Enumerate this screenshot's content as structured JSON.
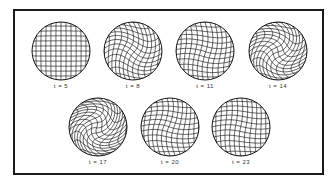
{
  "figure": {
    "panels": [
      {
        "label": "t = 5",
        "t": 5,
        "cx": 61,
        "cy": 51,
        "r": 29,
        "twist": 0.0,
        "wave": 0.0
      },
      {
        "label": "t = 8",
        "t": 8,
        "cx": 133,
        "cy": 51,
        "r": 29,
        "twist": 0.25,
        "wave": 0.35
      },
      {
        "label": "t = 11",
        "t": 11,
        "cx": 205,
        "cy": 51,
        "r": 29,
        "twist": 0.1,
        "wave": 0.2
      },
      {
        "label": "t = 14",
        "t": 14,
        "cx": 278,
        "cy": 51,
        "r": 29,
        "twist": 0.45,
        "wave": 0.3
      },
      {
        "label": "t = 17",
        "t": 17,
        "cx": 98,
        "cy": 127,
        "r": 29,
        "twist": 0.6,
        "wave": 0.45
      },
      {
        "label": "t = 20",
        "t": 20,
        "cx": 170,
        "cy": 127,
        "r": 29,
        "twist": 0.15,
        "wave": 0.3
      },
      {
        "label": "t = 23",
        "t": 23,
        "cx": 241,
        "cy": 127,
        "r": 29,
        "twist": 0.1,
        "wave": 0.2
      }
    ],
    "grid_lines": 14,
    "line_color": "#222222"
  }
}
